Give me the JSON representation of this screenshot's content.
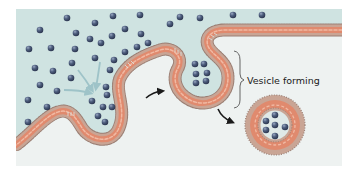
{
  "figure": {
    "label_vesicle_forming": "Vesicle forming"
  },
  "colors": {
    "page_background": "#ffffff",
    "extracellular": "#cfe3e1",
    "cytoplasm": "#eef3f2",
    "membrane_outer": "#b9a69a",
    "membrane_core": "#e08a6e",
    "membrane_inner": "#f0b9a3",
    "head_dots": "#9a7f74",
    "molecule": "#4a5a7a",
    "molecule_highlight": "#8a9ab8",
    "intake_arrow": "#9ec3c8",
    "process_arrow": "#1a1a1a",
    "bracket": "#555555"
  },
  "molecules": {
    "outside": [
      [
        67,
        18
      ],
      [
        113,
        16
      ],
      [
        140,
        15
      ],
      [
        180,
        17
      ],
      [
        200,
        18
      ],
      [
        233,
        15
      ],
      [
        262,
        15
      ],
      [
        40,
        30
      ],
      [
        95,
        23
      ],
      [
        125,
        29
      ],
      [
        170,
        24
      ],
      [
        76,
        33
      ],
      [
        90,
        39
      ],
      [
        112,
        42
      ],
      [
        141,
        34
      ],
      [
        148,
        44
      ],
      [
        29,
        49
      ],
      [
        51,
        48
      ],
      [
        75,
        49
      ],
      [
        101,
        44
      ],
      [
        125,
        52
      ],
      [
        137,
        47
      ],
      [
        95,
        58
      ],
      [
        114,
        58
      ],
      [
        35,
        68
      ],
      [
        53,
        71
      ],
      [
        72,
        63
      ],
      [
        110,
        68
      ],
      [
        71,
        78
      ],
      [
        105,
        86
      ],
      [
        40,
        85
      ],
      [
        57,
        91
      ],
      [
        28,
        100
      ],
      [
        47,
        107
      ],
      [
        106,
        95
      ],
      [
        28,
        122
      ]
    ],
    "invagination": [
      [
        92,
        101
      ],
      [
        103,
        107
      ],
      [
        111,
        106
      ],
      [
        98,
        116
      ],
      [
        106,
        121
      ],
      [
        103,
        97
      ]
    ],
    "pit": [
      [
        196,
        63
      ],
      [
        205,
        63
      ],
      [
        197,
        73
      ],
      [
        208,
        73
      ],
      [
        197,
        83
      ],
      [
        206,
        80
      ]
    ],
    "vesicle": [
      [
        275,
        115
      ],
      [
        266,
        121
      ],
      [
        275,
        125
      ],
      [
        285,
        127
      ],
      [
        267,
        130
      ],
      [
        275,
        136
      ]
    ]
  }
}
